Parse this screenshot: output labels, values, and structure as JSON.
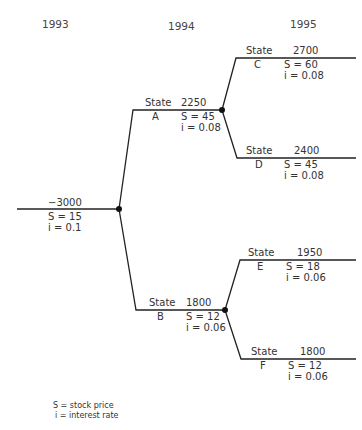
{
  "years": [
    "1993",
    "1994",
    "1995"
  ],
  "root": {
    "value": "−3000",
    "S": "S = 15",
    "i": "i = 0.1"
  },
  "nodes": {
    "A": {
      "state_label": "State",
      "state": "A",
      "value": "2250",
      "S": "S = 45",
      "i": "i = 0.08"
    },
    "B": {
      "state_label": "State",
      "state": "B",
      "value": "1800",
      "S": "S = 12",
      "i": "i = 0.06"
    },
    "C": {
      "state_label": "State",
      "state": "C",
      "value": "2700",
      "S": "S = 60",
      "i": "i = 0.08"
    },
    "D": {
      "state_label": "State",
      "state": "D",
      "value": "2400",
      "S": "S = 45",
      "i": "i = 0.08"
    },
    "E": {
      "state_label": "State",
      "state": "E",
      "value": "1950",
      "S": "S = 18",
      "i": "i = 0.06"
    },
    "F": {
      "state_label": "State",
      "state": "F",
      "value": "1800",
      "S": "S = 12",
      "i": "i = 0.06"
    }
  },
  "legend": {
    "S": "S = stock price",
    "i": "i = interest rate"
  }
}
